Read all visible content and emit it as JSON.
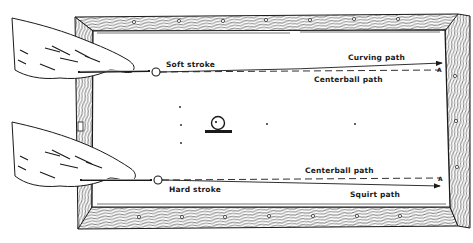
{
  "diagram": {
    "colors": {
      "ink": "#1a1a1a",
      "background": "#ffffff",
      "rail_hatch": "#333333"
    },
    "top_shot": {
      "stroke_label": "Soft stroke",
      "actual_path_label": "Curving path",
      "reference_path_label": "Centerball path",
      "target_marker": "A"
    },
    "bottom_shot": {
      "stroke_label": "Hard stroke",
      "reference_path_label": "Centerball path",
      "actual_path_label": "Squirt path",
      "target_marker": "A"
    },
    "icons": {
      "cue_ball": "cue-ball-icon",
      "object_ball": "object-ball-icon",
      "hand": "hand-icon",
      "diamond": "rail-diamond-icon"
    }
  }
}
